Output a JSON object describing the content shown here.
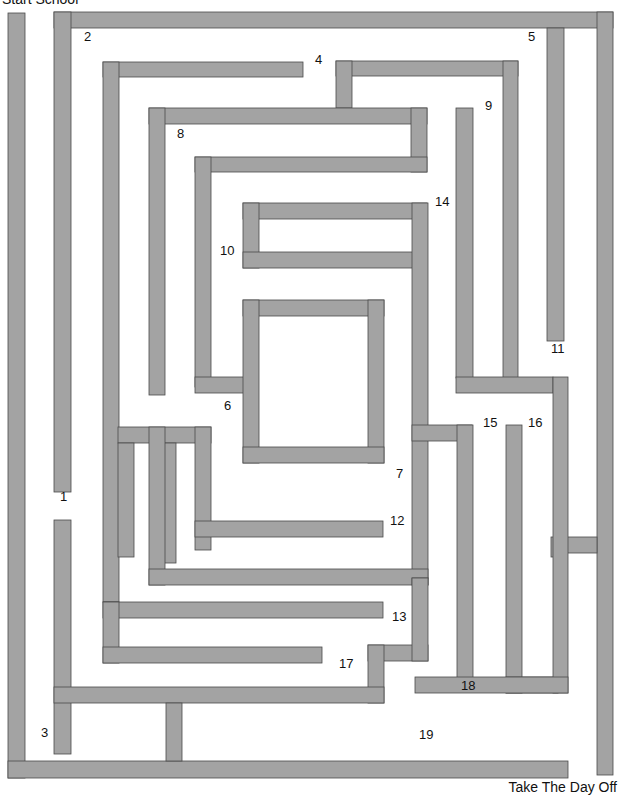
{
  "start_label": "Start School",
  "finish_label": "Take The Day Off",
  "colors": {
    "wall_fill": "#a3a3a3",
    "wall_stroke": "#4a4a4a",
    "background": "#ffffff"
  },
  "labels": [
    {
      "text": "1",
      "x": 60,
      "y": 500
    },
    {
      "text": "2",
      "x": 84,
      "y": 40
    },
    {
      "text": "3",
      "x": 41,
      "y": 736
    },
    {
      "text": "4",
      "x": 315,
      "y": 63
    },
    {
      "text": "5",
      "x": 528,
      "y": 40
    },
    {
      "text": "6",
      "x": 224,
      "y": 409
    },
    {
      "text": "7",
      "x": 396,
      "y": 477
    },
    {
      "text": "8",
      "x": 177,
      "y": 137
    },
    {
      "text": "9",
      "x": 485,
      "y": 109
    },
    {
      "text": "10",
      "x": 220,
      "y": 254
    },
    {
      "text": "11",
      "x": 551,
      "y": 352
    },
    {
      "text": "12",
      "x": 390,
      "y": 524
    },
    {
      "text": "13",
      "x": 392,
      "y": 620
    },
    {
      "text": "14",
      "x": 435,
      "y": 205
    },
    {
      "text": "15",
      "x": 483,
      "y": 426
    },
    {
      "text": "16",
      "x": 528,
      "y": 426
    },
    {
      "text": "17",
      "x": 339,
      "y": 667
    },
    {
      "text": "18",
      "x": 461,
      "y": 689
    },
    {
      "text": "19",
      "x": 419,
      "y": 738
    }
  ],
  "walls": [
    [
      8,
      13,
      17,
      765
    ],
    [
      8,
      761,
      560,
      17
    ],
    [
      54,
      12,
      559,
      16
    ],
    [
      54,
      12,
      17,
      480
    ],
    [
      597,
      12,
      16,
      763
    ],
    [
      547,
      28,
      17,
      313
    ],
    [
      564,
      28,
      0,
      0
    ],
    [
      564,
      537,
      33,
      16
    ],
    [
      551,
      537,
      16,
      20
    ],
    [
      103,
      62,
      200,
      15
    ],
    [
      103,
      62,
      16,
      540
    ],
    [
      336,
      61,
      182,
      15
    ],
    [
      336,
      61,
      16,
      47
    ],
    [
      503,
      61,
      15,
      320
    ],
    [
      149,
      108,
      278,
      16
    ],
    [
      411,
      108,
      16,
      64
    ],
    [
      149,
      108,
      16,
      287
    ],
    [
      195,
      157,
      232,
      15
    ],
    [
      195,
      157,
      16,
      230
    ],
    [
      195,
      377,
      52,
      16
    ],
    [
      243,
      203,
      184,
      16
    ],
    [
      243,
      203,
      16,
      65
    ],
    [
      243,
      252,
      184,
      16
    ],
    [
      412,
      203,
      16,
      375
    ],
    [
      243,
      300,
      141,
      16
    ],
    [
      243,
      300,
      16,
      163
    ],
    [
      368,
      300,
      16,
      163
    ],
    [
      243,
      447,
      141,
      16
    ],
    [
      456,
      108,
      17,
      270
    ],
    [
      456,
      377,
      97,
      16
    ],
    [
      487,
      108,
      0,
      0
    ],
    [
      502,
      377,
      16,
      0
    ],
    [
      412,
      578,
      16,
      0
    ],
    [
      412,
      425,
      60,
      16
    ],
    [
      457,
      425,
      16,
      254
    ],
    [
      506,
      425,
      16,
      268
    ],
    [
      506,
      677,
      52,
      16
    ],
    [
      553,
      377,
      15,
      316
    ],
    [
      415,
      677,
      153,
      16
    ],
    [
      118,
      427,
      93,
      16
    ],
    [
      118,
      443,
      16,
      114
    ],
    [
      161,
      443,
      15,
      120
    ],
    [
      195,
      427,
      16,
      123
    ],
    [
      195,
      521,
      188,
      16
    ],
    [
      149,
      427,
      16,
      158
    ],
    [
      149,
      569,
      279,
      16
    ],
    [
      412,
      578,
      16,
      7
    ],
    [
      103,
      602,
      280,
      16
    ],
    [
      103,
      602,
      16,
      61
    ],
    [
      103,
      647,
      219,
      16
    ],
    [
      118,
      618,
      0,
      0
    ],
    [
      368,
      645,
      60,
      16
    ],
    [
      412,
      578,
      16,
      83
    ],
    [
      368,
      645,
      16,
      58
    ],
    [
      54,
      520,
      17,
      234
    ],
    [
      54,
      687,
      330,
      16
    ],
    [
      166,
      703,
      16,
      58
    ]
  ]
}
